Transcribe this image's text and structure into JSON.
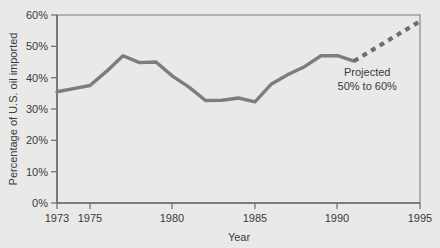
{
  "chart_data": {
    "type": "line",
    "title": "",
    "xlabel": "Year",
    "ylabel": "Percentage of U.S. oil imported",
    "xlim": [
      1973,
      1995
    ],
    "ylim": [
      0,
      60
    ],
    "grid": false,
    "legend": null,
    "x_ticks": [
      "1973",
      "1975",
      "1980",
      "1985",
      "1990",
      "1995"
    ],
    "x_tick_values": [
      1973,
      1975,
      1980,
      1985,
      1990,
      1995
    ],
    "y_ticks": [
      "0%",
      "10%",
      "20%",
      "30%",
      "40%",
      "50%",
      "60%"
    ],
    "y_tick_values": [
      0,
      10,
      20,
      30,
      40,
      50,
      60
    ],
    "series": [
      {
        "name": "Actual",
        "style": "solid",
        "color": "#7d7d7d",
        "x": [
          1973,
          1974,
          1975,
          1976,
          1977,
          1978,
          1979,
          1980,
          1981,
          1982,
          1983,
          1984,
          1985,
          1986,
          1987,
          1988,
          1989,
          1990,
          1991
        ],
        "values": [
          35.5,
          36.5,
          37.5,
          42.0,
          47.0,
          44.8,
          45.0,
          40.5,
          37.0,
          32.7,
          32.8,
          33.5,
          32.3,
          38.0,
          41.0,
          43.5,
          47.0,
          47.0,
          45.3
        ]
      },
      {
        "name": "Projected",
        "style": "dashed",
        "color": "#6e6e6e",
        "x": [
          1991,
          1995
        ],
        "values": [
          45.3,
          58.0
        ]
      }
    ],
    "annotations": [
      {
        "id": "projected-note",
        "line1": "Projected",
        "line2": "50% to 60%",
        "x": 1991.8,
        "y": 40.5
      }
    ],
    "colors": {
      "background": "#e9e9e9",
      "plot_background": "#e9e9e9",
      "axis": "#6b6b6b",
      "text": "#3a3a3a",
      "line": "#7d7d7d",
      "projected_line": "#6e6e6e"
    }
  }
}
